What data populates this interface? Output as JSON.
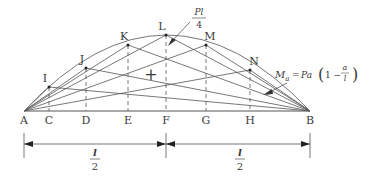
{
  "diagram": {
    "colors": {
      "line": "#555555",
      "curve": "#666666",
      "text": "#3a3a3a",
      "background": "#ffffff"
    },
    "baseline_y": 111,
    "support_points": [
      {
        "id": "A",
        "label": "A",
        "x": 24
      },
      {
        "id": "B",
        "label": "B",
        "x": 310
      }
    ],
    "section_points": [
      {
        "id": "C",
        "label": "C",
        "x": 49,
        "apex": {
          "label": "I",
          "y": 87
        }
      },
      {
        "id": "D",
        "label": "D",
        "x": 86,
        "apex": {
          "label": "J",
          "y": 68
        }
      },
      {
        "id": "E",
        "label": "E",
        "x": 128,
        "apex": {
          "label": "K",
          "y": 45
        }
      },
      {
        "id": "F",
        "label": "F",
        "x": 166,
        "apex": {
          "label": "L",
          "y": 35
        }
      },
      {
        "id": "G",
        "label": "G",
        "x": 206,
        "apex": {
          "label": "M",
          "y": 45
        }
      },
      {
        "id": "H",
        "label": "H",
        "x": 250,
        "apex": {
          "label": "N",
          "y": 70
        }
      }
    ],
    "plus_sign": "+",
    "annotations": {
      "peak_value": {
        "numerator": "Pl",
        "denominator": "4"
      },
      "envelope_formula": {
        "lhs_base": "M",
        "lhs_sub": "a",
        "equals": "=",
        "rhs_prefix": "Pa",
        "paren_open": "(",
        "one_minus": "1 −",
        "frac_num": "a",
        "frac_den": "l",
        "paren_close": ")"
      }
    },
    "dimensions": [
      {
        "from": "A",
        "to": "F",
        "label_num": "l",
        "label_den": "2"
      },
      {
        "from": "F",
        "to": "B",
        "label_num": "l",
        "label_den": "2"
      }
    ]
  }
}
